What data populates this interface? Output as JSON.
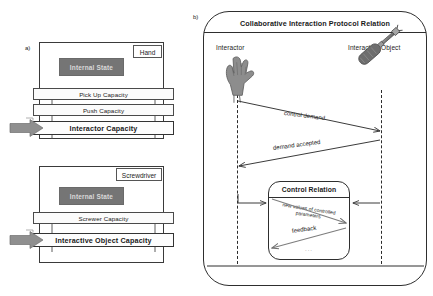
{
  "figure": {
    "part_a_tag": "a)",
    "part_b_tag": "b)"
  },
  "left": {
    "interactor": {
      "name_tab": "Hand",
      "internal_state": "Internal State",
      "capacities": [
        "Pick Up Capacity",
        "Push Capacity"
      ],
      "main_capacity": "Interactor Capacity"
    },
    "interactive_object": {
      "name_tab": "Screwdriver",
      "internal_state": "Internal State",
      "capacities": [
        "Screwer Capacity"
      ],
      "main_capacity": "Interactive Object Capacity"
    }
  },
  "right": {
    "title": "Collaborative Interaction Protocol Relation",
    "participants": [
      {
        "label": "Interactor",
        "icon": "hand-icon"
      },
      {
        "label": "Interactive Object",
        "icon": "screwdriver-icon"
      }
    ],
    "messages": [
      {
        "label": "control demand",
        "direction": "left-to-right"
      },
      {
        "label": "demand accepted",
        "direction": "right-to-left"
      }
    ],
    "control_relation": {
      "title": "Control Relation",
      "messages": [
        {
          "label": "new values of controlled parameters",
          "direction": "left-to-right"
        },
        {
          "label": "feedback",
          "direction": "right-to-left"
        }
      ],
      "continuation": "..."
    }
  },
  "colors": {
    "stroke": "#2e2e2e",
    "internal_state_fill": "#757575",
    "internal_state_text": "#d9d9d9",
    "block_arrow_fill": "#8f8f8f",
    "background": "#ffffff"
  }
}
